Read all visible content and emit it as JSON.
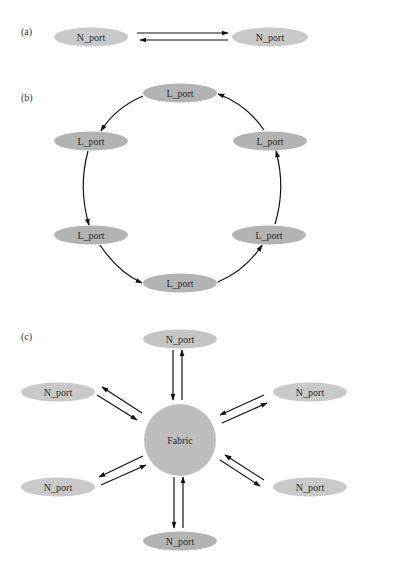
{
  "colors": {
    "port_light": "#c9c9c9",
    "port_dark": "#b3b3b3",
    "fabric": "#bdbdbd",
    "edge": "#111111",
    "text": "#2a2a2a"
  },
  "panels": [
    {
      "id": "a",
      "label": "(a)",
      "label_pos": [
        21,
        35
      ],
      "title": "Point-to-point",
      "nodes": [
        {
          "label": "N_port",
          "cx": 91,
          "cy": 37,
          "rx": 37,
          "ry": 9.5,
          "fill": "#c9c9c9"
        },
        {
          "label": "N_port",
          "cx": 270,
          "cy": 37,
          "rx": 38,
          "ry": 9.5,
          "fill": "#c9c9c9"
        }
      ],
      "edges": [
        {
          "x1": 137,
          "y1": 33,
          "x2": 228,
          "y2": 33,
          "type": "line"
        },
        {
          "x1": 228,
          "y1": 40,
          "x2": 140,
          "y2": 40,
          "type": "line"
        }
      ]
    },
    {
      "id": "b",
      "label": "(b)",
      "label_pos": [
        21,
        101
      ],
      "title": "Arbitrated loop",
      "nodes": [
        {
          "label": "L_port",
          "cx": 180,
          "cy": 93,
          "rx": 37,
          "ry": 9.5,
          "fill": "#b3b3b3"
        },
        {
          "label": "L_port",
          "cx": 91,
          "cy": 141,
          "rx": 37,
          "ry": 9.5,
          "fill": "#b3b3b3"
        },
        {
          "label": "L_port",
          "cx": 91,
          "cy": 235,
          "rx": 37,
          "ry": 9.5,
          "fill": "#b3b3b3"
        },
        {
          "label": "L_port",
          "cx": 180,
          "cy": 283,
          "rx": 37,
          "ry": 9.5,
          "fill": "#b3b3b3"
        },
        {
          "label": "L_port",
          "cx": 269,
          "cy": 235,
          "rx": 37,
          "ry": 9.5,
          "fill": "#b3b3b3"
        },
        {
          "label": "L_port",
          "cx": 270,
          "cy": 141,
          "rx": 37,
          "ry": 9.5,
          "fill": "#b3b3b3"
        }
      ],
      "edges": [
        {
          "d": "M 143 96 Q 115 108 101 131",
          "type": "path"
        },
        {
          "d": "M 88 151 Q 78 188 89 225",
          "type": "path"
        },
        {
          "d": "M 100 245 Q 118 272 142 283",
          "type": "path"
        },
        {
          "d": "M 218 282 Q 246 270 262 245",
          "type": "path"
        },
        {
          "d": "M 275 224 Q 286 188 276 151",
          "type": "path"
        },
        {
          "d": "M 264 130 Q 246 104 218 94",
          "type": "path"
        }
      ]
    },
    {
      "id": "c",
      "label": "(c)",
      "label_pos": [
        21,
        340
      ],
      "title": "Switched fabric",
      "hub": {
        "label": "Fabric",
        "cx": 180,
        "cy": 440,
        "r": 36,
        "fill": "#bdbdbd"
      },
      "nodes": [
        {
          "label": "N_port",
          "cx": 180,
          "cy": 339,
          "rx": 37,
          "ry": 9.5,
          "fill": "#c4c4c4"
        },
        {
          "label": "N_port",
          "cx": 58,
          "cy": 392,
          "rx": 37,
          "ry": 9.5,
          "fill": "#c9c9c9"
        },
        {
          "label": "N_port",
          "cx": 310,
          "cy": 392,
          "rx": 37,
          "ry": 9.5,
          "fill": "#c9c9c9"
        },
        {
          "label": "N_port",
          "cx": 58,
          "cy": 487,
          "rx": 37,
          "ry": 9.5,
          "fill": "#c9c9c9"
        },
        {
          "label": "N_port",
          "cx": 310,
          "cy": 487,
          "rx": 37,
          "ry": 9.5,
          "fill": "#c9c9c9"
        },
        {
          "label": "N_port",
          "cx": 180,
          "cy": 541,
          "rx": 37,
          "ry": 9.5,
          "fill": "#b3b3b3"
        }
      ],
      "edges": [
        {
          "x1": 173,
          "y1": 350,
          "x2": 173,
          "y2": 400,
          "type": "line"
        },
        {
          "x1": 182,
          "y1": 400,
          "x2": 182,
          "y2": 350,
          "type": "line"
        },
        {
          "x1": 97,
          "y1": 395,
          "x2": 137,
          "y2": 420,
          "type": "line"
        },
        {
          "x1": 142,
          "y1": 413,
          "x2": 102,
          "y2": 387,
          "type": "line"
        },
        {
          "x1": 264,
          "y1": 395,
          "x2": 220,
          "y2": 415,
          "type": "line"
        },
        {
          "x1": 222,
          "y1": 423,
          "x2": 267,
          "y2": 403,
          "type": "line"
        },
        {
          "x1": 143,
          "y1": 456,
          "x2": 99,
          "y2": 477,
          "type": "line"
        },
        {
          "x1": 101,
          "y1": 485,
          "x2": 146,
          "y2": 465,
          "type": "line"
        },
        {
          "x1": 264,
          "y1": 480,
          "x2": 225,
          "y2": 455,
          "type": "line"
        },
        {
          "x1": 220,
          "y1": 460,
          "x2": 260,
          "y2": 486,
          "type": "line"
        },
        {
          "x1": 174,
          "y1": 477,
          "x2": 174,
          "y2": 528,
          "type": "line"
        },
        {
          "x1": 183,
          "y1": 528,
          "x2": 183,
          "y2": 477,
          "type": "line"
        }
      ]
    }
  ]
}
